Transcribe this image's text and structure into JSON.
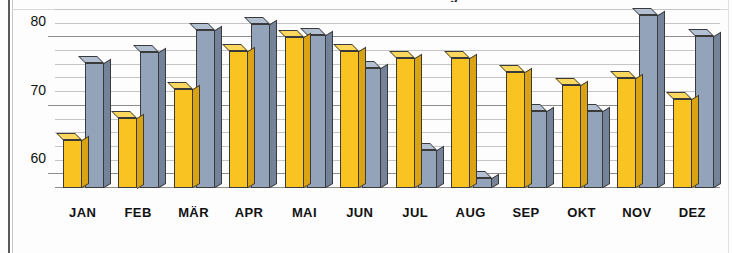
{
  "chart": {
    "title_clipped": "Durchschnittliche Auslastung",
    "frame_color": "#5a5a5a",
    "series_colors": [
      "#f9c422",
      "#93a3ba"
    ]
  },
  "chart_data": {
    "type": "bar",
    "title": "",
    "xlabel": "",
    "ylabel": "",
    "ylim": [
      58,
      84
    ],
    "yticks": [
      60,
      70,
      80
    ],
    "ytick_labels": [
      "60",
      "70",
      "80"
    ],
    "minor_tick_step": 2,
    "grid": true,
    "legend": "none",
    "categories": [
      "JAN",
      "FEB",
      "MÄR",
      "APR",
      "MAI",
      "JUN",
      "JUL",
      "AUG",
      "SEP",
      "OKT",
      "NOV",
      "DEZ"
    ],
    "series": [
      {
        "name": "Serie 1",
        "color": "#f9c422",
        "values": [
          65.0,
          68.3,
          72.4,
          78.0,
          80.1,
          78.0,
          77.0,
          77.0,
          75.0,
          73.0,
          74.0,
          71.0
        ]
      },
      {
        "name": "Serie 2",
        "color": "#93a3ba",
        "values": [
          76.2,
          77.8,
          81.1,
          82.0,
          80.3,
          75.5,
          63.5,
          59.5,
          69.2,
          69.2,
          83.2,
          80.2
        ]
      }
    ]
  }
}
